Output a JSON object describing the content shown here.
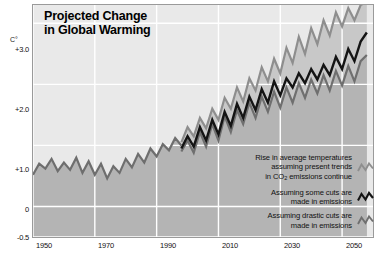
{
  "chart_title_line1": "Projected Change",
  "chart_title_line2": "in Global Warming",
  "axes": {
    "unit_label": "C°",
    "y_ticks": [
      "+3.0",
      "+2.0",
      "+1.0",
      "0",
      "-0.5"
    ],
    "x_ticks": [
      "1950",
      "1970",
      "1990",
      "2010",
      "2030",
      "2050"
    ]
  },
  "legend": [
    {
      "line1": "Rise in average temperatures",
      "line2": "assuming present trends",
      "line3_pre": "in CO",
      "line3_sub": "2",
      "line3_post": " emissions continue",
      "icon": "zigzag-icon",
      "color": "#8e8e8e"
    },
    {
      "line1": "Assuming some cuts are",
      "line2": "made in emissions",
      "icon": "zigzag-icon",
      "color": "#141414"
    },
    {
      "line1": "Assuming drastic cuts are",
      "line2": "made in emissions",
      "icon": "zigzag-icon",
      "color": "#6f6f6f"
    }
  ],
  "colors": {
    "plot_background": "#e9e9e9",
    "fill_band": "#c8c8c8",
    "fill_band_deep": "#b4b4b4",
    "gridline": "#ffffff",
    "historical_line": "#6e6e6e",
    "high_line": "#8e8e8e",
    "mid_line": "#141414",
    "low_line": "#6f6f6f",
    "frame": "#9a9a9a"
  },
  "chart_data": {
    "type": "line",
    "title": "Projected Change in Global Warming",
    "xlabel": "",
    "ylabel": "C°",
    "xlim": [
      1950,
      2060
    ],
    "ylim": [
      -0.5,
      3.3
    ],
    "grid": true,
    "legend_position": "inside-bottom-right",
    "x_tick_values": [
      1950,
      1970,
      1990,
      2010,
      2030,
      2050
    ],
    "y_tick_values": [
      3.0,
      2.0,
      1.0,
      0,
      -0.5
    ],
    "series": [
      {
        "name": "Historical observed",
        "color": "#6e6e6e",
        "x": [
          1950,
          1952,
          1954,
          1956,
          1958,
          1960,
          1962,
          1964,
          1966,
          1968,
          1970,
          1972,
          1974,
          1976,
          1978,
          1980,
          1982,
          1984,
          1986,
          1988,
          1990,
          1992,
          1994,
          1996,
          1998
        ],
        "values": [
          0.52,
          0.7,
          0.62,
          0.78,
          0.58,
          0.72,
          0.6,
          0.8,
          0.55,
          0.74,
          0.52,
          0.7,
          0.46,
          0.66,
          0.55,
          0.78,
          0.64,
          0.86,
          0.72,
          0.95,
          0.82,
          1.02,
          0.92,
          1.12,
          1.0
        ]
      },
      {
        "name": "Rise in average temperatures assuming present trends in CO2 emissions continue",
        "color": "#8e8e8e",
        "x": [
          1998,
          2000,
          2002,
          2004,
          2006,
          2008,
          2010,
          2012,
          2014,
          2016,
          2018,
          2020,
          2022,
          2024,
          2026,
          2028,
          2030,
          2032,
          2034,
          2036,
          2038,
          2040,
          2042,
          2044,
          2046,
          2048,
          2050,
          2052,
          2054,
          2056,
          2058
        ],
        "values": [
          1.05,
          1.3,
          1.15,
          1.45,
          1.28,
          1.6,
          1.42,
          1.78,
          1.6,
          1.95,
          1.72,
          2.1,
          1.9,
          2.28,
          2.05,
          2.42,
          2.18,
          2.6,
          2.35,
          2.78,
          2.5,
          2.92,
          2.66,
          3.05,
          2.8,
          3.18,
          2.95,
          3.25,
          3.05,
          3.3,
          3.35
        ]
      },
      {
        "name": "Assuming some cuts are made in emissions",
        "color": "#141414",
        "x": [
          1998,
          2000,
          2002,
          2004,
          2006,
          2008,
          2010,
          2012,
          2014,
          2016,
          2018,
          2020,
          2022,
          2024,
          2026,
          2028,
          2030,
          2032,
          2034,
          2036,
          2038,
          2040,
          2042,
          2044,
          2046,
          2048,
          2050,
          2052,
          2054,
          2056,
          2058
        ],
        "values": [
          0.95,
          1.15,
          0.98,
          1.3,
          1.08,
          1.42,
          1.18,
          1.55,
          1.32,
          1.68,
          1.45,
          1.8,
          1.58,
          1.92,
          1.7,
          2.05,
          1.82,
          2.1,
          1.95,
          2.18,
          2.02,
          2.25,
          2.08,
          2.32,
          2.15,
          2.45,
          2.25,
          2.58,
          2.38,
          2.7,
          2.85
        ]
      },
      {
        "name": "Assuming drastic cuts are made in emissions",
        "color": "#6f6f6f",
        "x": [
          1998,
          2000,
          2002,
          2004,
          2006,
          2008,
          2010,
          2012,
          2014,
          2016,
          2018,
          2020,
          2022,
          2024,
          2026,
          2028,
          2030,
          2032,
          2034,
          2036,
          2038,
          2040,
          2042,
          2044,
          2046,
          2048,
          2050,
          2052,
          2054,
          2056,
          2058
        ],
        "values": [
          0.9,
          1.08,
          0.88,
          1.22,
          0.98,
          1.35,
          1.08,
          1.48,
          1.22,
          1.58,
          1.35,
          1.7,
          1.45,
          1.8,
          1.55,
          1.88,
          1.62,
          1.95,
          1.7,
          2.02,
          1.78,
          2.08,
          1.85,
          2.15,
          1.9,
          2.22,
          1.98,
          2.3,
          2.05,
          2.38,
          2.48
        ]
      }
    ]
  }
}
